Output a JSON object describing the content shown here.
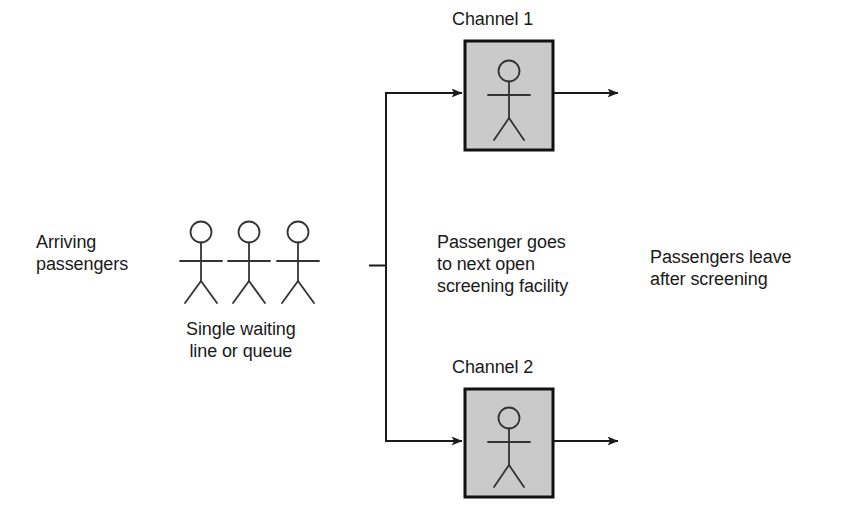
{
  "diagram": {
    "colors": {
      "line": "#1a1a1a",
      "text": "#1a1a1a",
      "box_fill": "#cacaca",
      "box_stroke": "#111111",
      "background": "#ffffff"
    },
    "labels": {
      "arriving_passengers": "Arriving\npassengers",
      "single_waiting_line": "Single waiting\nline or queue",
      "channel_1": "Channel 1",
      "channel_2": "Channel 2",
      "routing_note": "Passenger goes\nto next open\nscreening facility",
      "passengers_leave": "Passengers leave\nafter screening"
    },
    "queue": {
      "figure_count": 3,
      "figures": [
        {
          "name": "queue-passenger-1",
          "cx": 201
        },
        {
          "name": "queue-passenger-2",
          "cx": 248
        },
        {
          "name": "queue-passenger-3",
          "cx": 297
        }
      ]
    },
    "channels": [
      {
        "id": "channel-1",
        "label": "Channel 1",
        "box": {
          "x": 465,
          "y": 41,
          "width": 88,
          "height": 109
        },
        "inbound_arrow_y": 93,
        "outbound_arrow_y": 93
      },
      {
        "id": "channel-2",
        "label": "Channel 2",
        "box": {
          "x": 465,
          "y": 389,
          "width": 88,
          "height": 108
        },
        "inbound_arrow_y": 441,
        "outbound_arrow_y": 441
      }
    ],
    "connector": {
      "stub_y": 265,
      "stub_x_start": 369,
      "stub_x_end": 386,
      "trunk_x": 386,
      "trunk_y_top": 93,
      "trunk_y_bottom": 441
    }
  }
}
